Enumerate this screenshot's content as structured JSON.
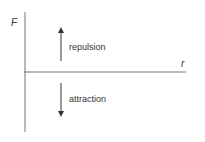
{
  "diagram": {
    "axes": {
      "y_label": "F",
      "x_label": "r"
    },
    "annotations": {
      "up_arrow_label": "repulsion",
      "down_arrow_label": "attraction"
    },
    "colors": {
      "axis": "#555555",
      "text": "#333333"
    }
  }
}
